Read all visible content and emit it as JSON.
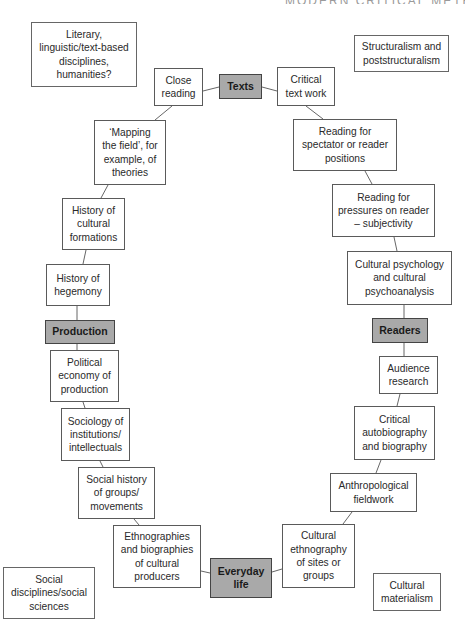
{
  "header": {
    "running_title": "MODERN CRITICAL METHODS"
  },
  "colors": {
    "hub_fill": "#a9a9a9",
    "border": "#5a5a5a",
    "line": "#555555"
  },
  "hubs": {
    "texts": "Texts",
    "production": "Production",
    "readers": "Readers",
    "everyday_life": "Everyday\nlife"
  },
  "domains": {
    "literary": "Literary,\nlinguistic/text-based\ndisciplines,\nhumanities?",
    "structuralism": "Structuralism and\npoststructuralism",
    "social_disciplines": "Social\ndisciplines/social\nsciences",
    "cultural_materialism": "Cultural\nmaterialism"
  },
  "nodes": {
    "close_reading": "Close\nreading",
    "critical_text_work": "Critical\ntext work",
    "mapping_the_field": "‘Mapping\nthe field’, for\nexample, of\ntheories",
    "history_cultural_formations": "History of\ncultural\nformations",
    "history_hegemony": "History of\nhegemony",
    "political_economy": "Political\neconomy of\nproduction",
    "sociology_institutions": "Sociology of\ninstitutions/\nintellectuals",
    "social_history": "Social history\nof groups/\nmovements",
    "ethnographies_biographies": "Ethnographies\nand biographies\nof cultural\nproducers",
    "reading_spectator": "Reading for\nspectator or reader\npositions",
    "reading_pressures": "Reading for\npressures on reader\n– subjectivity",
    "cultural_psychology": "Cultural psychology\nand cultural\npsychoanalysis",
    "audience_research": "Audience\nresearch",
    "critical_autobiography": "Critical\nautobiography\nand biography",
    "anthropological_fieldwork": "Anthropological\nfieldwork",
    "cultural_ethnography": "Cultural\nethnography\nof sites or\ngroups"
  }
}
